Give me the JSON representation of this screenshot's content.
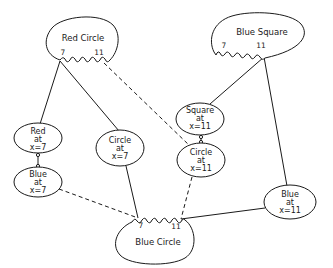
{
  "diagram": {
    "type": "semantic-network",
    "frames": [
      {
        "id": "red_circle",
        "label": "Red Circle",
        "ports": [
          "7",
          "11"
        ]
      },
      {
        "id": "blue_square",
        "label": "Blue Square",
        "ports": [
          "7",
          "11"
        ]
      },
      {
        "id": "blue_circle",
        "label": "Blue Circle",
        "ports": [
          "7",
          "11"
        ]
      }
    ],
    "nodes": [
      {
        "id": "red_at_7",
        "lines": [
          "Red",
          "at",
          "x=7"
        ]
      },
      {
        "id": "blue_at_7",
        "lines": [
          "Blue",
          "at",
          "x=7"
        ]
      },
      {
        "id": "circle_at_7",
        "lines": [
          "Circle",
          "at",
          "x=7"
        ]
      },
      {
        "id": "square_at_11",
        "lines": [
          "Square",
          "at",
          "x=11"
        ]
      },
      {
        "id": "circle_at_11",
        "lines": [
          "Circle",
          "at",
          "x=11"
        ]
      },
      {
        "id": "blue_at_11",
        "lines": [
          "Blue",
          "at",
          "x=11"
        ]
      }
    ],
    "edges": [
      {
        "from": "red_circle.7",
        "to": "red_at_7",
        "style": "solid"
      },
      {
        "from": "red_circle.7",
        "to": "circle_at_7",
        "style": "solid"
      },
      {
        "from": "red_circle.11",
        "to": "circle_at_11",
        "style": "dashed"
      },
      {
        "from": "red_at_7",
        "to": "blue_at_7",
        "style": "solid-link"
      },
      {
        "from": "blue_at_7",
        "to": "blue_circle.7",
        "style": "dashed"
      },
      {
        "from": "circle_at_7",
        "to": "blue_circle.7",
        "style": "solid"
      },
      {
        "from": "blue_square.11",
        "to": "square_at_11",
        "style": "solid"
      },
      {
        "from": "blue_square.11",
        "to": "blue_at_11",
        "style": "solid"
      },
      {
        "from": "square_at_11",
        "to": "circle_at_11",
        "style": "solid-link"
      },
      {
        "from": "circle_at_11",
        "to": "blue_circle.11",
        "style": "dashed"
      },
      {
        "from": "blue_at_11",
        "to": "blue_circle.11",
        "style": "solid"
      }
    ]
  },
  "labels": {
    "red_circle": {
      "title": "Red Circle",
      "p7": "7",
      "p11": "11"
    },
    "blue_square": {
      "title": "Blue Square",
      "p7": "7",
      "p11": "11"
    },
    "blue_circle": {
      "title": "Blue Circle",
      "p7": "7",
      "p11": "11"
    },
    "red_at_7": {
      "l1": "Red",
      "l2": "at",
      "l3": "x=7"
    },
    "blue_at_7": {
      "l1": "Blue",
      "l2": "at",
      "l3": "x=7"
    },
    "circle_at_7": {
      "l1": "Circle",
      "l2": "at",
      "l3": "x=7"
    },
    "square_at_11": {
      "l1": "Square",
      "l2": "at",
      "l3": "x=11"
    },
    "circle_at_11": {
      "l1": "Circle",
      "l2": "at",
      "l3": "x=11"
    },
    "blue_at_11": {
      "l1": "Blue",
      "l2": "at",
      "l3": "x=11"
    }
  }
}
